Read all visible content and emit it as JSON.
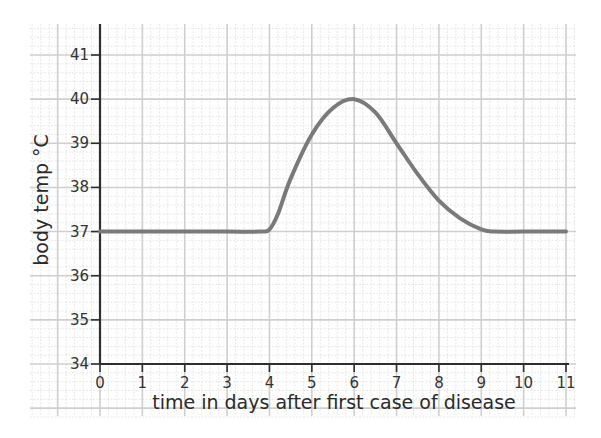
{
  "chart_data": {
    "type": "line",
    "title": "",
    "xlabel": "time in days after first case of disease",
    "ylabel": "body temp °C",
    "xlim": [
      0,
      11
    ],
    "ylim": [
      34,
      41
    ],
    "xticks": [
      0,
      1,
      2,
      3,
      4,
      5,
      6,
      7,
      8,
      9,
      10,
      11
    ],
    "yticks": [
      34,
      35,
      36,
      37,
      38,
      39,
      40,
      41
    ],
    "grid": true,
    "legend": null,
    "series": [
      {
        "name": "body temperature",
        "color": "#7a7a7a",
        "x": [
          0,
          1,
          2,
          3,
          3.8,
          4.0,
          4.2,
          4.5,
          5.0,
          5.5,
          6.0,
          6.5,
          7.0,
          7.5,
          8.0,
          8.5,
          9.0,
          9.3,
          10.0,
          11.0
        ],
        "y": [
          37.0,
          37.0,
          37.0,
          37.0,
          37.0,
          37.05,
          37.4,
          38.2,
          39.2,
          39.8,
          40.0,
          39.7,
          39.0,
          38.3,
          37.7,
          37.3,
          37.05,
          37.0,
          37.0,
          37.0
        ]
      }
    ]
  },
  "colors": {
    "grid_major": "#cfcfcf",
    "grid_minor": "#e2e2e2",
    "axis": "#2e2e2e",
    "curve": "#7a7a7a"
  }
}
